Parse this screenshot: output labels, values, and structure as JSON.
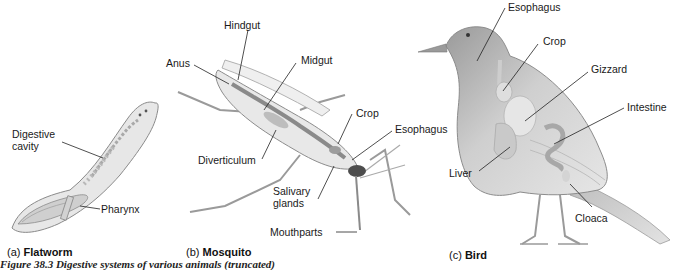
{
  "figure": {
    "caption_truncated": "Figure 38.3 Digestive systems of various animals (truncated)",
    "panels": [
      {
        "id": "a",
        "letter": "(a)",
        "title": "Flatworm",
        "labels": [
          "Digestive cavity",
          "Pharynx"
        ]
      },
      {
        "id": "b",
        "letter": "(b)",
        "title": "Mosquito",
        "labels": [
          "Hindgut",
          "Anus",
          "Midgut",
          "Crop",
          "Esophagus",
          "Diverticulum",
          "Salivary glands",
          "Mouthparts"
        ]
      },
      {
        "id": "c",
        "letter": "(c)",
        "title": "Bird",
        "labels": [
          "Esophagus",
          "Crop",
          "Gizzard",
          "Intestine",
          "Liver",
          "Cloaca"
        ]
      }
    ]
  },
  "flatworm": {
    "letter": "(a)",
    "title": "Flatworm",
    "digestive_line1": "Digestive",
    "digestive_line2": "cavity",
    "pharynx": "Pharynx"
  },
  "mosquito": {
    "letter": "(b)",
    "title": "Mosquito",
    "hindgut": "Hindgut",
    "anus": "Anus",
    "midgut": "Midgut",
    "crop": "Crop",
    "esophagus": "Esophagus",
    "diverticulum": "Diverticulum",
    "salivary_line1": "Salivary",
    "salivary_line2": "glands",
    "mouthparts": "Mouthparts"
  },
  "bird": {
    "letter": "(c)",
    "title": "Bird",
    "esophagus": "Esophagus",
    "crop": "Crop",
    "gizzard": "Gizzard",
    "intestine": "Intestine",
    "liver": "Liver",
    "cloaca": "Cloaca"
  },
  "caption": {
    "text": "Figure 38.3 Digestive systems of various animals (truncated)"
  }
}
